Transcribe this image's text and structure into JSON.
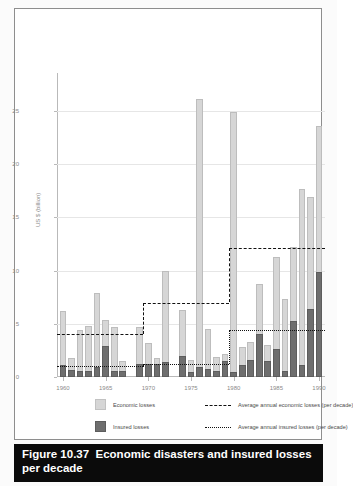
{
  "figure": {
    "number": "Figure 10.37",
    "title": "Economic disasters and insured losses per decade"
  },
  "legend": {
    "economic_swatch_label": "Economic losses",
    "insured_swatch_label": "Insured losses",
    "avg_economic_label": "Average annual economic losses (per decade)",
    "avg_insured_label": "Average annual insured losses (per decade)"
  },
  "chart_data": {
    "type": "bar",
    "title": "Economic disasters and insured losses per decade",
    "xlabel": "",
    "ylabel": "US $ (billion)",
    "ylim": [
      0,
      28
    ],
    "xlim": [
      1959.3,
      1990.7
    ],
    "yticks": [
      "0",
      "5",
      "10",
      "15",
      "20",
      "25"
    ],
    "ytick_values": [
      0,
      5,
      10,
      15,
      20,
      25
    ],
    "xticks": [
      "1960",
      "1965",
      "1970",
      "1975",
      "1980",
      "1985",
      "1990"
    ],
    "xtick_values": [
      1960,
      1965,
      1970,
      1975,
      1980,
      1985,
      1990
    ],
    "grid": "horizontal",
    "legend_position": "below-plot",
    "stacked": true,
    "colors": {
      "economic": "#d6d6d6",
      "insured": "#6e6e6e",
      "avg_economic_line": "#111111",
      "avg_insured_line": "#111111",
      "gridline": "#e6e6e6",
      "axis": "#b9b9b9",
      "caption_background": "#0b0b0b",
      "caption_text": "#ffffff"
    },
    "years": [
      1960,
      1961,
      1962,
      1963,
      1964,
      1965,
      1966,
      1967,
      1969,
      1970,
      1971,
      1972,
      1974,
      1975,
      1976,
      1977,
      1978,
      1979,
      1980,
      1981,
      1982,
      1983,
      1984,
      1985,
      1986,
      1987,
      1988,
      1989,
      1990
    ],
    "series": [
      {
        "name": "Economic losses",
        "values": [
          6.2,
          1.8,
          4.4,
          4.8,
          7.9,
          5.4,
          4.7,
          1.5,
          4.7,
          3.2,
          1.8,
          10.0,
          6.3,
          1.6,
          26.1,
          4.5,
          1.9,
          2.2,
          24.9,
          2.8,
          3.3,
          8.7,
          3.0,
          11.3,
          7.3,
          12.2,
          17.7,
          16.9,
          23.6
        ]
      },
      {
        "name": "Insured losses",
        "values": [
          1.1,
          0.7,
          0.6,
          0.6,
          0.9,
          2.9,
          0.6,
          0.6,
          1.2,
          1.2,
          1.2,
          1.4,
          2.0,
          0.5,
          0.9,
          0.8,
          0.6,
          1.5,
          0.5,
          1.1,
          1.6,
          4.0,
          1.5,
          2.6,
          0.6,
          5.3,
          1.1,
          6.4,
          9.9
        ]
      }
    ],
    "average_lines": [
      {
        "name": "Average annual economic losses (per decade)",
        "style": "dashed",
        "decade": "1960s",
        "x_start": 1959.3,
        "x_end": 1969.4,
        "value": 4.0
      },
      {
        "name": "Average annual economic losses (per decade)",
        "style": "dashed",
        "decade": "1970s",
        "x_start": 1969.4,
        "x_end": 1979.5,
        "value": 7.0
      },
      {
        "name": "Average annual economic losses (per decade)",
        "style": "dashed",
        "decade": "1980s",
        "x_start": 1979.5,
        "x_end": 1990.7,
        "value": 12.1
      },
      {
        "name": "Average annual insured losses (per decade)",
        "style": "dotted",
        "decade": "1960s",
        "x_start": 1959.3,
        "x_end": 1969.4,
        "value": 1.0
      },
      {
        "name": "Average annual insured losses (per decade)",
        "style": "dotted",
        "decade": "1970s",
        "x_start": 1969.4,
        "x_end": 1979.5,
        "value": 1.2
      },
      {
        "name": "Average annual insured losses (per decade)",
        "style": "dotted",
        "decade": "1980s",
        "x_start": 1979.5,
        "x_end": 1990.7,
        "value": 4.4
      }
    ]
  }
}
